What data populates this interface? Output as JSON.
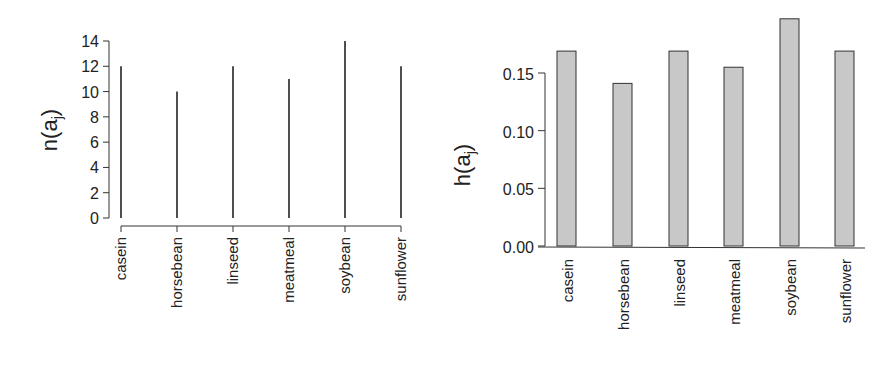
{
  "chart_data": [
    {
      "type": "bar",
      "style": "needle",
      "title": "",
      "xlabel": "",
      "ylabel": "n(a_j)",
      "ylabel_main": "n(a",
      "ylabel_sub": "j",
      "ylabel_close": ")",
      "categories": [
        "casein",
        "horsebean",
        "linseed",
        "meatmeal",
        "soybean",
        "sunflower"
      ],
      "values": [
        12,
        10,
        12,
        11,
        14,
        12
      ],
      "yticks": [
        "0",
        "2",
        "4",
        "6",
        "8",
        "10",
        "12",
        "14"
      ],
      "ylim": [
        0,
        14
      ],
      "grid": false
    },
    {
      "type": "bar",
      "title": "",
      "xlabel": "",
      "ylabel": "h(a_j)",
      "ylabel_main": "h(a",
      "ylabel_sub": "j",
      "ylabel_close": ")",
      "categories": [
        "casein",
        "horsebean",
        "linseed",
        "meatmeal",
        "soybean",
        "sunflower"
      ],
      "values": [
        0.169,
        0.141,
        0.169,
        0.155,
        0.197,
        0.169
      ],
      "yticks": [
        "0.00",
        "0.05",
        "0.10",
        "0.15"
      ],
      "ylim": [
        0,
        0.2
      ],
      "bar_color": "#c8c8c8",
      "grid": false
    }
  ]
}
